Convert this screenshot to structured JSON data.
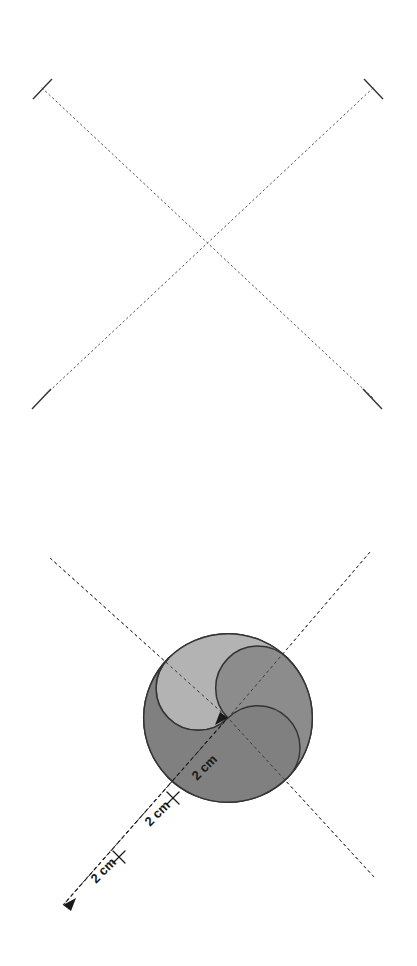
{
  "page": {
    "background_color": "#ffffff",
    "width": 417,
    "height": 966
  },
  "figures": [
    {
      "id": "axes-only",
      "name": "diagonal-cross-axes",
      "description": "Two crossing dotted diagonal lines forming an X, with perpendicular end ticks at all four endpoints",
      "line_style": "dotted",
      "line_color": "#555555",
      "endpoints": [
        {
          "name": "top-left",
          "x": 42,
          "y": 88
        },
        {
          "name": "top-right",
          "x": 373,
          "y": 88
        },
        {
          "name": "bottom-left",
          "x": 42,
          "y": 398
        },
        {
          "name": "bottom-right",
          "x": 373,
          "y": 398
        }
      ],
      "center": {
        "x": 207,
        "y": 243
      },
      "tick_length": 22
    },
    {
      "id": "pinwheel",
      "name": "four-blade-pinwheel",
      "description": "Four S-shaped curved blades arranged in 90-degree rotational symmetry around a common center point, each blade traversed by a dotted diagonal axis",
      "center": {
        "x": 228,
        "y": 238
      },
      "blades": [
        {
          "name": "blade-top-left",
          "fill": "#b3b3b3",
          "stroke": "#333333",
          "rotation_deg": 180
        },
        {
          "name": "blade-top-right",
          "fill": "#8c8c8c",
          "stroke": "#333333",
          "rotation_deg": 270
        },
        {
          "name": "blade-bottom-right",
          "fill": "#808080",
          "stroke": "#333333",
          "rotation_deg": 0
        },
        {
          "name": "blade-bottom-left",
          "fill": "#e0e0e0",
          "stroke": "#333333",
          "rotation_deg": 90
        }
      ],
      "axis_line_style": "dashed",
      "axis_line_color": "#555555",
      "dimensions": {
        "unit": "cm",
        "segment_length_label": "2 cm",
        "segment_count": 3,
        "total_label": "6 cm",
        "labels": [
          {
            "name": "dimension-label-outer",
            "text": "2 cm",
            "x": 104,
            "y": 871,
            "rotation_deg": -45
          },
          {
            "name": "dimension-label-middle",
            "text": "2 cm",
            "x": 160,
            "y": 815,
            "rotation_deg": -45
          },
          {
            "name": "dimension-label-inner",
            "text": "2 cm",
            "x": 204,
            "y": 772,
            "rotation_deg": -45
          }
        ],
        "arrow_start": {
          "x": 63,
          "y": 905
        },
        "arrow_end": {
          "x": 228,
          "y": 718
        },
        "tick_marks": [
          {
            "name": "dimension-tick-1",
            "x": 118,
            "y": 856
          },
          {
            "name": "dimension-tick-2",
            "x": 173,
            "y": 797
          }
        ]
      }
    }
  ],
  "colors": {
    "blade_light": "#e0e0e0",
    "blade_medium": "#b3b3b3",
    "blade_dark": "#8c8c8c",
    "blade_darkest": "#808080",
    "outline": "#333333",
    "guide_line": "#555555",
    "label_text": "#1a1a1a",
    "background": "#ffffff"
  }
}
